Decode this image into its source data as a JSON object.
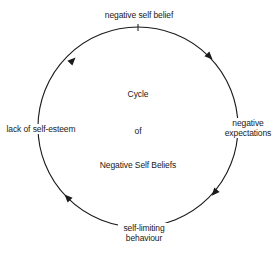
{
  "diagram": {
    "type": "cycle",
    "title_lines": [
      "Cycle",
      "of",
      "Negative Self Beliefs"
    ],
    "nodes": [
      {
        "id": "top",
        "label": "negative self belief"
      },
      {
        "id": "right",
        "label_lines": [
          "negative",
          "expectations"
        ]
      },
      {
        "id": "bottom",
        "label_lines": [
          "self-limiting",
          "behaviour"
        ]
      },
      {
        "id": "left",
        "label": "lack of self-esteem"
      }
    ],
    "edges": [
      {
        "from": "negative self belief",
        "to": "negative expectations",
        "direction": "clockwise"
      },
      {
        "from": "negative expectations",
        "to": "self-limiting behaviour",
        "direction": "clockwise"
      },
      {
        "from": "self-limiting behaviour",
        "to": "lack of self-esteem",
        "direction": "clockwise"
      },
      {
        "from": "lack of self-esteem",
        "to": "negative self belief",
        "direction": "clockwise"
      }
    ],
    "colors": {
      "line": "#1a1a1a",
      "background": "#ffffff",
      "text": "#1a1a1a"
    }
  }
}
